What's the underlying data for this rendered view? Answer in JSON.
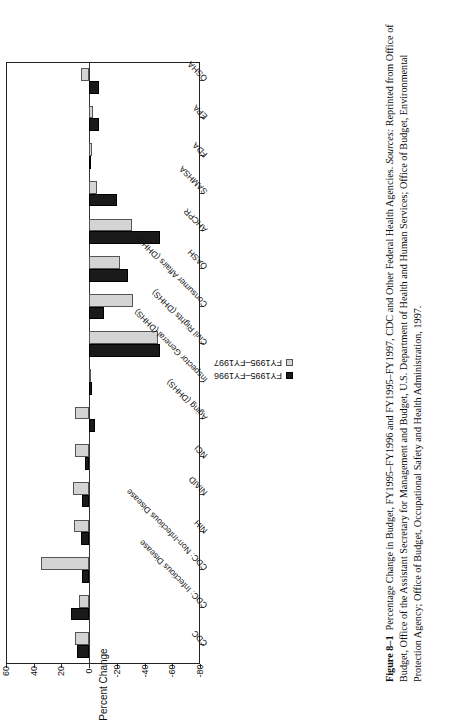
{
  "figure": {
    "label": "Figure 8–1",
    "caption_main": "Percentage Change in Budget, FY1995–FY1996 and FY1995–FY1997, CDC and Other Federal Health Agencies.",
    "sources_label": "Sources:",
    "sources_text": "Reprinted from Office of Budget, Office of the Assistant Secretary for Management and Budget, U.S. Department of Health and Human Services; Office of Budget, Environmental Protection Agency; Office of Budget, Occupational Safety and Health Administration, 1997."
  },
  "legend": {
    "position": "inside-right",
    "entries": [
      {
        "label": "FY1995–FY1996",
        "color": "#1a1a1a",
        "swatch": "filled-black-square"
      },
      {
        "label": "FY1995–FY1997",
        "color": "#d4d4d4",
        "swatch": "filled-gray-square"
      }
    ]
  },
  "chart_data": {
    "type": "bar",
    "orientation": "vertical-printed-sideways",
    "title": "",
    "subtitle": "",
    "xlabel": "",
    "ylabel": "Percent Change",
    "ylim": [
      -80,
      60
    ],
    "yticks": [
      60,
      40,
      20,
      0,
      -20,
      -40,
      -60,
      -80
    ],
    "ytick_labels": [
      "60",
      "40",
      "20",
      "0",
      "-20",
      "-40",
      "-60",
      "-80"
    ],
    "grid": false,
    "legend_position": "inside-right",
    "categories": [
      "CDC",
      "CDC: Infectious Disease",
      "CDC: Non-Infectious Disease",
      "NIH",
      "NIAID",
      "NCI",
      "Aging (DHHS)",
      "Inspector General (DHHS)",
      "Civil Rights (DHHS)",
      "Consumer Affairs (DHHS)",
      "OASH",
      "AHCPR",
      "SAMHSA",
      "FDA",
      "EPA",
      "OSHA"
    ],
    "series": [
      {
        "name": "FY1995–FY1996",
        "color": "#1a1a1a",
        "values": [
          9,
          13,
          5,
          6,
          5,
          3,
          -4,
          -2,
          -51,
          -11,
          -28,
          -51,
          -20,
          -1,
          -7,
          -7
        ]
      },
      {
        "name": "FY1995–FY1997",
        "color": "#d4d4d4",
        "values": [
          10,
          7,
          35,
          11,
          12,
          10,
          10,
          -1,
          -50,
          -32,
          -22,
          -31,
          -6,
          -2,
          -3,
          6
        ]
      }
    ]
  }
}
